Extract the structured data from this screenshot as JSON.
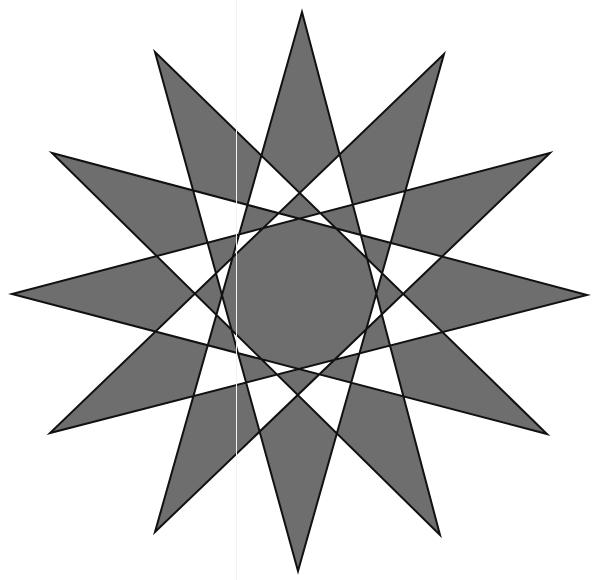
{
  "figure": {
    "title": "",
    "shape": "star polygon",
    "schlafli": "{12/5}",
    "points": 12,
    "step": 5,
    "fill_rule": "evenodd",
    "colors": {
      "background": "#ffffff",
      "fill": "#6e6e6e",
      "stroke": "#111111"
    },
    "stroke_width": 2,
    "vertices": [
      [
        302,
        12
      ],
      [
        444,
        54
      ],
      [
        550,
        153
      ],
      [
        587,
        295
      ],
      [
        547,
        434
      ],
      [
        440,
        535
      ],
      [
        298,
        571
      ],
      [
        155,
        532
      ],
      [
        50,
        433
      ],
      [
        12,
        294
      ],
      [
        52,
        153
      ],
      [
        155,
        52
      ]
    ]
  }
}
